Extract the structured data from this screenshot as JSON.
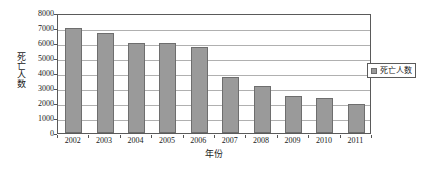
{
  "chart_data": {
    "type": "bar",
    "title": "",
    "subtitle": "",
    "xlabel": "年份",
    "ylabel": "死亡人数",
    "categories": [
      "2002",
      "2003",
      "2004",
      "2005",
      "2006",
      "2007",
      "2008",
      "2009",
      "2010",
      "2011"
    ],
    "values": [
      7000,
      6700,
      6000,
      6000,
      5750,
      3750,
      3150,
      2500,
      2350,
      1950
    ],
    "series": [
      {
        "name": "死亡人数",
        "values": [
          7000,
          6700,
          6000,
          6000,
          5750,
          3750,
          3150,
          2500,
          2350,
          1950
        ]
      }
    ],
    "ylim": [
      0,
      8000
    ],
    "y_ticks": [
      "0",
      "1000",
      "2000",
      "3000",
      "4000",
      "5000",
      "6000",
      "7000",
      "8000"
    ],
    "y_tick_values": [
      0,
      1000,
      2000,
      3000,
      4000,
      5000,
      6000,
      7000,
      8000
    ],
    "y_tick_interval": 1000,
    "grid": "horizontal",
    "legend": {
      "position": "right",
      "entries": [
        {
          "label": "死亡人数",
          "swatch": "legend-swatch-icon",
          "color": "#9a9a9a"
        }
      ]
    },
    "colors": {
      "bar_fill": "#9a9a9a",
      "bar_border": "#6e6e6e",
      "gridline": "#b0b0b0",
      "axis": "#5a5a5a",
      "text": "#1a1a1a",
      "plot_background": "#ffffff"
    }
  }
}
